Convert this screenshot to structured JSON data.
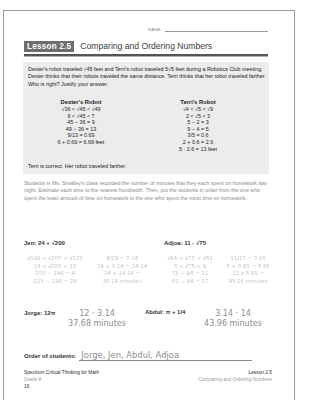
{
  "header": {
    "name_label": "NAME",
    "lesson_badge": "Lesson 2.5",
    "lesson_title": "Comparing and Ordering Numbers"
  },
  "example": {
    "prompt": "Dexter's robot traveled √45 feet and Terri's robot traveled 5√5 feet during a Robotics Club meeting. Dexter thinks that their robots traveled the same distance. Terri thinks that her robot traveled farther. Who is right? Justify your answer.",
    "dexter": {
      "title": "Dexter's Robot",
      "lines": [
        "√36 < √45 < √49",
        "6 < √45 < 7",
        "45 − 36 = 9",
        "49 − 36 = 13",
        "9/13 = 0.69",
        "6 + 0.69 = 6.69 feet"
      ]
    },
    "terri": {
      "title": "Terri's Robot",
      "lines": [
        "√4 < √5 < √9",
        "2 < √5 < 3",
        "5 − 2 = 3",
        "9 − 4 = 5",
        "3/5 = 0.6",
        "2 + 0.6 = 2.6",
        "5 · 2.6 = 13 feet"
      ]
    },
    "answer": "Terri is correct. Her robot traveled farther."
  },
  "problem": {
    "text": "Students in Ms. Smalley's class recorded the number of minutes that they each spent on homework last night. Estimate each time to the nearest hundredth. Then, put the students in order from the one who spent the least amount of time on homework to the one who spent the most time on homework."
  },
  "students": {
    "jen": {
      "label": "Jen: 24 + √200",
      "work_left": [
        "√196 < √200 < √225",
        "14 < √200 < 15",
        "200 − 196 = 4",
        "225 − 196 = 29"
      ],
      "work_right": [
        "4/29 = 0.14",
        "14 + 0.14 = 14.14",
        "24 + 14.14 =",
        "38.14 minutes"
      ]
    },
    "adjoa": {
      "label": "Adjoa: 11 · √75",
      "work_left": [
        "√64 < √75 < √81",
        "8 < √75 < 9",
        "75 − 64 = 11",
        "81 − 64 = 17"
      ],
      "work_right": [
        "11/17 = 0.65",
        "8 + 0.65 = 8.65",
        "11 x 8.65 =",
        "95.15 minutes"
      ]
    },
    "jorge": {
      "label": "Jorge: 12π",
      "work": [
        "12 · 3.14",
        "37.68 minutes"
      ]
    },
    "abdul": {
      "label": "Abdul: π + 1/4",
      "work": [
        "3.14 · 14",
        "43.96 minutes"
      ]
    }
  },
  "order": {
    "label": "Order of students:",
    "answer": "Jorge, Jen, Abdul, Adjoa"
  },
  "footer": {
    "book_title": "Spectrum Critical Thinking for Math",
    "grade": "Grade 8",
    "page_number": "16",
    "lesson": "Lesson 2.5",
    "lesson_title": "Comparing and Ordering Numbers"
  }
}
